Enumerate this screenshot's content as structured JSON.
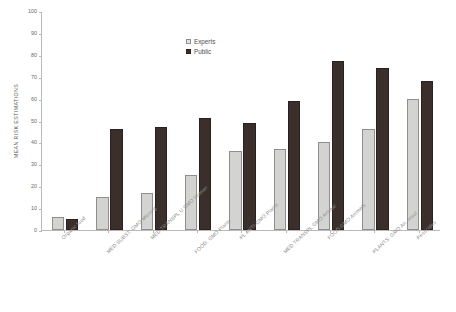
{
  "chart_data": {
    "type": "bar",
    "title": "",
    "xlabel": "",
    "ylabel": "MEAN RISK ESTIMATIONS",
    "ylim": [
      0,
      100
    ],
    "ytick_step": 10,
    "yticks": [
      "100",
      "90",
      "80",
      "70",
      "60",
      "50",
      "40",
      "30",
      "20",
      "10",
      "0"
    ],
    "grid": false,
    "legend_position": "top-center",
    "categories": [
      "Organic food",
      "MED SUBST. GMO Microrg",
      "MED TRANSPL U GMO Human",
      "FOOD: GMO Plants",
      "PL ANTI-GMO Plants",
      "MED TRANSPL GMO Animal",
      "FOOD:GMO Animals",
      "PLANTS: GMO An. Insul",
      "Pesticides"
    ],
    "series": [
      {
        "name": "Experts",
        "color": "#d3d4d2",
        "values": [
          6,
          15,
          17,
          25,
          36,
          37,
          40,
          46,
          60
        ]
      },
      {
        "name": "Public",
        "color": "#3a2f2b",
        "values": [
          5,
          46,
          47,
          51,
          49,
          59,
          77,
          74,
          68
        ]
      }
    ]
  },
  "legend": {
    "items": [
      {
        "label": "Experts"
      },
      {
        "label": "Public"
      }
    ]
  }
}
